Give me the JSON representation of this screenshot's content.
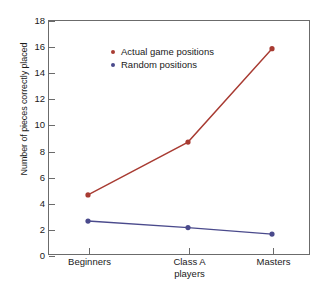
{
  "chart_data": {
    "type": "line",
    "title": "",
    "xlabel": "",
    "ylabel": "Number of pieces correctly placed",
    "categories": [
      "Beginners",
      "Class A players",
      "Masters"
    ],
    "category_lines": [
      [
        "Beginners"
      ],
      [
        "Class A",
        "players"
      ],
      [
        "Masters"
      ]
    ],
    "ylim": [
      0,
      18
    ],
    "ytick_labels": [
      "0",
      "2",
      "4",
      "6",
      "8",
      "10",
      "12",
      "14",
      "16",
      "18"
    ],
    "ytick_values": [
      0,
      2,
      4,
      6,
      8,
      10,
      12,
      14,
      16,
      18
    ],
    "grid": false,
    "legend_position": "top-left",
    "series": [
      {
        "name": "Actual game positions",
        "color": "#a83b32",
        "values": [
          4.6,
          8.65,
          15.8
        ]
      },
      {
        "name": "Random positions",
        "color": "#4a4a8c",
        "values": [
          2.6,
          2.1,
          1.6
        ]
      }
    ]
  },
  "legend": {
    "items": [
      {
        "label": "Actual game positions",
        "color": "#a83b32"
      },
      {
        "label": "Random positions",
        "color": "#4a4a8c"
      }
    ]
  },
  "axes": {
    "y_title": "Number of pieces correctly placed",
    "y_ticks": [
      "18",
      "16",
      "14",
      "12",
      "10",
      "8",
      "6",
      "4",
      "2",
      "0"
    ],
    "x_ticks": [
      {
        "line1": "Beginners",
        "line2": ""
      },
      {
        "line1": "Class A",
        "line2": "players"
      },
      {
        "line1": "Masters",
        "line2": ""
      }
    ]
  },
  "colors": {
    "series_actual": "#a83b32",
    "series_random": "#4a4a8c",
    "frame": "#6b6b6b",
    "text": "#1a1a1a",
    "background": "#ffffff"
  }
}
